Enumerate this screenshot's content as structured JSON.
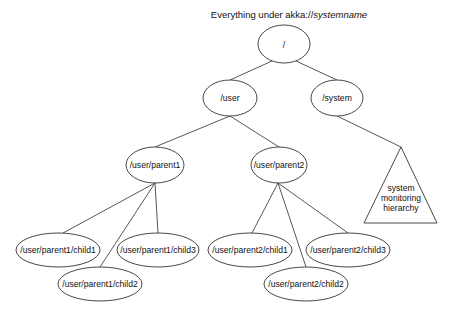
{
  "title": {
    "prefix": "Everything under akka://",
    "emphasis": "systemname"
  },
  "colors": {
    "stroke": "#333333",
    "text": "#111111",
    "background": "#ffffff"
  },
  "nodes": {
    "root": {
      "label": "/",
      "cx": 284,
      "cy": 44,
      "rx": 26,
      "ry": 19
    },
    "user": {
      "label": "/user",
      "cx": 230,
      "cy": 98,
      "rx": 27,
      "ry": 18
    },
    "system": {
      "label": "/system",
      "cx": 337,
      "cy": 98,
      "rx": 26,
      "ry": 18
    },
    "parent1": {
      "label": "/user/parent1",
      "cx": 155,
      "cy": 165,
      "rx": 29,
      "ry": 18
    },
    "parent2": {
      "label": "/user/parent2",
      "cx": 279,
      "cy": 165,
      "rx": 28,
      "ry": 18
    },
    "p1child1": {
      "label": "/user/parent1/child1",
      "cx": 58,
      "cy": 250,
      "rx": 42,
      "ry": 17
    },
    "p1child2": {
      "label": "/user/parent1/child2",
      "cx": 100,
      "cy": 284,
      "rx": 42,
      "ry": 17
    },
    "p1child3": {
      "label": "/user/parent1/child3",
      "cx": 158,
      "cy": 250,
      "rx": 41,
      "ry": 17
    },
    "p2child1": {
      "label": "/user/parent2/child1",
      "cx": 250,
      "cy": 250,
      "rx": 42,
      "ry": 17
    },
    "p2child2": {
      "label": "/user/parent2/child2",
      "cx": 306,
      "cy": 284,
      "rx": 42,
      "ry": 17
    },
    "p2child3": {
      "label": "/user/parent2/child3",
      "cx": 348,
      "cy": 250,
      "rx": 42,
      "ry": 17
    }
  },
  "hierarchy_triangle": {
    "lines": [
      "system",
      "monitoring",
      "hierarchy"
    ],
    "apex": [
      401,
      147
    ],
    "base_left": [
      364,
      223
    ],
    "base_right": [
      437,
      223
    ]
  },
  "edges": [
    {
      "from": "root",
      "to": "user"
    },
    {
      "from": "root",
      "to": "system"
    },
    {
      "from": "user",
      "to": "parent1"
    },
    {
      "from": "user",
      "to": "parent2"
    },
    {
      "from": "system",
      "to": "system-monitoring-hierarchy"
    },
    {
      "from": "parent1",
      "to": "p1child1"
    },
    {
      "from": "parent1",
      "to": "p1child2"
    },
    {
      "from": "parent1",
      "to": "p1child3"
    },
    {
      "from": "parent2",
      "to": "p2child1"
    },
    {
      "from": "parent2",
      "to": "p2child2"
    },
    {
      "from": "parent2",
      "to": "p2child3"
    }
  ]
}
